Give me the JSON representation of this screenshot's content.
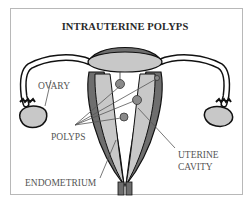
{
  "diagram": {
    "title": "INTRAUTERINE POLYPS",
    "labels": {
      "ovary": "OVARY",
      "polyps": "POLYPS",
      "uterine_cavity_line1": "UTERINE",
      "uterine_cavity_line2": "CAVITY",
      "endometrium": "ENDOMETRIUM"
    },
    "colors": {
      "outline": "#111111",
      "myometrium": "#6e6e6e",
      "endometrium": "#c8c8c8",
      "cavity": "#ffffff",
      "polyp": "#8a8a8a",
      "label_text": "#555555",
      "frame_border": "#b8b8b8"
    }
  }
}
